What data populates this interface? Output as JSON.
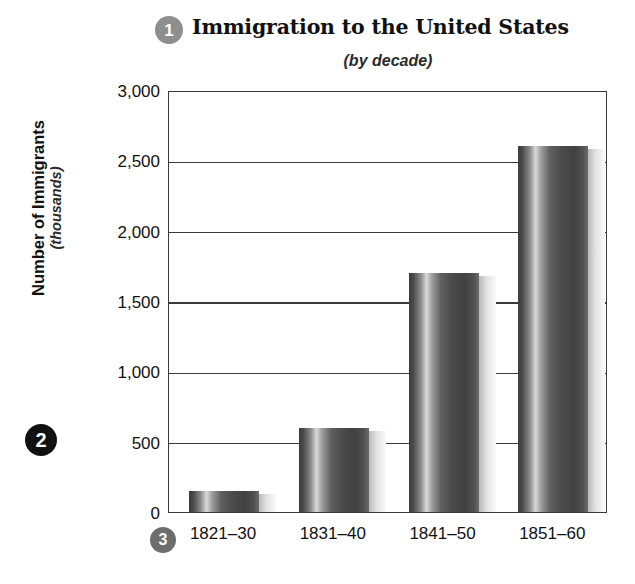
{
  "callouts": [
    {
      "id": 1,
      "label": "1",
      "color": "#8e8e8e"
    },
    {
      "id": 2,
      "label": "2",
      "color": "#111111"
    },
    {
      "id": 3,
      "label": "3",
      "color": "#6d6d6d"
    }
  ],
  "chart_data": {
    "type": "bar",
    "title": "Immigration to the United States",
    "subtitle": "(by decade)",
    "xlabel": "",
    "ylabel": "Number of Immigrants",
    "ylabel_sub": "(thousands)",
    "categories": [
      "1821–30",
      "1831–40",
      "1841–50",
      "1851–60"
    ],
    "values": [
      150,
      600,
      1700,
      2600
    ],
    "ylim": [
      0,
      3000
    ],
    "ytick_labels": [
      "3,000",
      "2,500",
      "2,000",
      "1,500",
      "1,000",
      "500",
      "0"
    ],
    "ytick_values": [
      3000,
      2500,
      2000,
      1500,
      1000,
      500,
      0
    ],
    "grid": true,
    "legend": "none",
    "bar_color": "#4a4a4a"
  }
}
